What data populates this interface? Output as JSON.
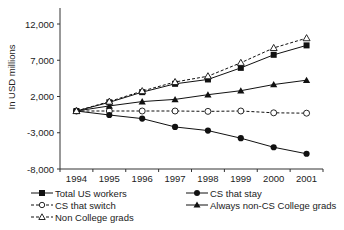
{
  "chart_data": {
    "type": "line",
    "title": "",
    "xlabel": "",
    "ylabel": "In USD millions",
    "ylim": [
      -8000,
      14000
    ],
    "yticks": [
      12000,
      7000,
      2000,
      -3000,
      -8000
    ],
    "ytick_labels": [
      "12,000",
      "7,000",
      "2,000",
      "-3,000",
      "-8,000"
    ],
    "categories": [
      "1994",
      "1995",
      "1996",
      "1997",
      "1998",
      "1999",
      "2000",
      "2001"
    ],
    "grid": false,
    "legend_position": "bottom",
    "series": [
      {
        "name": "Total US workers",
        "marker": "filled-square",
        "line": "solid",
        "values": [
          0,
          1200,
          2600,
          3750,
          4350,
          5950,
          7750,
          9050
        ]
      },
      {
        "name": "CS that stay",
        "marker": "filled-circle",
        "line": "solid",
        "values": [
          0,
          -550,
          -1050,
          -2200,
          -2700,
          -3750,
          -5000,
          -5900
        ]
      },
      {
        "name": "CS that switch",
        "marker": "open-circle",
        "line": "dashed",
        "values": [
          0,
          0,
          0,
          0,
          -50,
          0,
          -250,
          -300
        ]
      },
      {
        "name": "Always  non-CS College grads",
        "marker": "filled-triangle",
        "line": "solid",
        "values": [
          0,
          700,
          1300,
          1600,
          2250,
          2800,
          3650,
          4250
        ]
      },
      {
        "name": "Non College grads",
        "marker": "open-triangle",
        "line": "dashed",
        "values": [
          0,
          1300,
          2750,
          4000,
          4800,
          6650,
          8700,
          10050
        ]
      }
    ]
  },
  "legend": {
    "items": [
      {
        "label": "Total US workers"
      },
      {
        "label": "CS that stay"
      },
      {
        "label": "CS that switch"
      },
      {
        "label": "Always  non-CS College grads"
      },
      {
        "label": "Non College grads"
      }
    ]
  }
}
